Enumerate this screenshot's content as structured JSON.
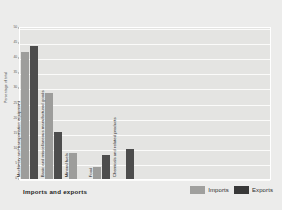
{
  "chart_data": {
    "type": "bar",
    "title": "Imports and exports",
    "xlabel": "",
    "ylabel": "Percentage of total",
    "ylim": [
      0,
      50
    ],
    "ytick_step": 5,
    "grid": true,
    "legend_position": "bottom-right",
    "categories": [
      "Machinery and transportation equipment",
      "Basic and miscellaneous manufactured goods",
      "Mineral fuels",
      "Food",
      "Chemicals and related products"
    ],
    "yticks": [
      "0",
      "5",
      "10",
      "15",
      "20",
      "25",
      "30",
      "35",
      "40",
      "45",
      "50"
    ],
    "series": [
      {
        "name": "Imports",
        "color": "#9d9d9b",
        "values": [
          42,
          28.5,
          8.5,
          4,
          0
        ]
      },
      {
        "name": "Exports",
        "color": "#4d4d4d",
        "values": [
          44,
          15.5,
          0,
          8,
          10
        ]
      }
    ]
  },
  "legend": {
    "imports_label": "Imports",
    "exports_label": "Exports"
  },
  "colors": {
    "imports": "#9d9d9b",
    "exports": "#4d4d4d",
    "plot_background": "#e4e4e2",
    "page_background": "#ececeb",
    "gridline": "#fbfbfa"
  }
}
